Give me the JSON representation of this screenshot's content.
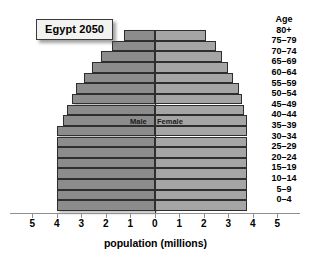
{
  "title": "Egypt 2050",
  "axis": {
    "xlabel": "population (millions)",
    "ticks": [
      "5",
      "4",
      "3",
      "2",
      "1",
      "0",
      "1",
      "2",
      "3",
      "4",
      "5"
    ],
    "age_header": "Age"
  },
  "legend": {
    "male": "Male",
    "female": "Female"
  },
  "colors": {
    "male_bar": "#8c8c8c",
    "female_bar": "#a5a5a5",
    "bar_outline": "#2e2e2e",
    "axis": "#8f8f8f",
    "background": "#ffffff"
  },
  "chart_data": {
    "type": "bar",
    "subtype": "population-pyramid",
    "title": "Egypt 2050",
    "xlabel": "population (millions)",
    "ylabel": "Age",
    "xlim": [
      -5,
      5
    ],
    "xticks": [
      -5,
      -4,
      -3,
      -2,
      -1,
      0,
      1,
      2,
      3,
      4,
      5
    ],
    "xticklabels": [
      "5",
      "4",
      "3",
      "2",
      "1",
      "0",
      "1",
      "2",
      "3",
      "4",
      "5"
    ],
    "grid": false,
    "legend_position": "center-inside",
    "categories": [
      "80+",
      "75-79",
      "70-74",
      "65-69",
      "60-64",
      "55-59",
      "50-54",
      "45-49",
      "40-44",
      "35-39",
      "30-34",
      "25-29",
      "20-24",
      "15-19",
      "10-14",
      "5-9",
      "0-4"
    ],
    "series": [
      {
        "name": "Male",
        "direction": "left",
        "values": [
          1.25,
          1.75,
          2.2,
          2.55,
          2.9,
          3.2,
          3.4,
          3.6,
          3.75,
          4.0,
          4.0,
          4.0,
          4.0,
          4.0,
          4.0,
          4.0,
          4.0
        ]
      },
      {
        "name": "Female",
        "direction": "right",
        "values": [
          2.1,
          2.5,
          2.75,
          3.0,
          3.2,
          3.45,
          3.55,
          3.65,
          3.75,
          3.75,
          3.75,
          3.75,
          3.75,
          3.75,
          3.75,
          3.75,
          3.75
        ]
      }
    ]
  }
}
